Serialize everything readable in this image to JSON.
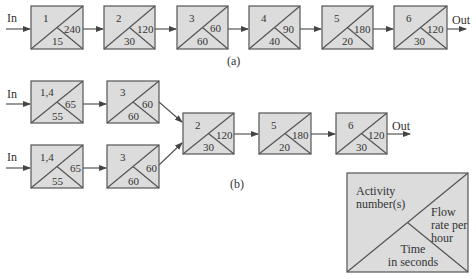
{
  "diagram": {
    "colors": {
      "box_fill": "#dcdcdc",
      "line": "#555555",
      "text": "#333333"
    },
    "layout_a": {
      "caption": "(a)",
      "input_label": "In",
      "output_label": "Out",
      "boxes": [
        {
          "activity": "1",
          "flow_rate": "240",
          "time": "15"
        },
        {
          "activity": "2",
          "flow_rate": "120",
          "time": "30"
        },
        {
          "activity": "3",
          "flow_rate": "60",
          "time": "60"
        },
        {
          "activity": "4",
          "flow_rate": "90",
          "time": "40"
        },
        {
          "activity": "5",
          "flow_rate": "180",
          "time": "20"
        },
        {
          "activity": "6",
          "flow_rate": "120",
          "time": "30"
        }
      ]
    },
    "layout_b": {
      "caption": "(b)",
      "input_labels": [
        "In",
        "In"
      ],
      "output_label": "Out",
      "parallel_lines": [
        [
          {
            "activity": "1,4",
            "flow_rate": "65",
            "time": "55"
          },
          {
            "activity": "3",
            "flow_rate": "60",
            "time": "60"
          }
        ],
        [
          {
            "activity": "1,4",
            "flow_rate": "65",
            "time": "55"
          },
          {
            "activity": "3",
            "flow_rate": "60",
            "time": "60"
          }
        ]
      ],
      "serial_boxes": [
        {
          "activity": "2",
          "flow_rate": "120",
          "time": "30"
        },
        {
          "activity": "5",
          "flow_rate": "180",
          "time": "20"
        },
        {
          "activity": "6",
          "flow_rate": "120",
          "time": "30"
        }
      ]
    },
    "legend": {
      "activity_label_1": "Activity",
      "activity_label_2": "number(s)",
      "flow_label_1": "Flow",
      "flow_label_2": "rate per",
      "flow_label_3": "hour",
      "time_label_1": "Time",
      "time_label_2": "in seconds"
    }
  }
}
